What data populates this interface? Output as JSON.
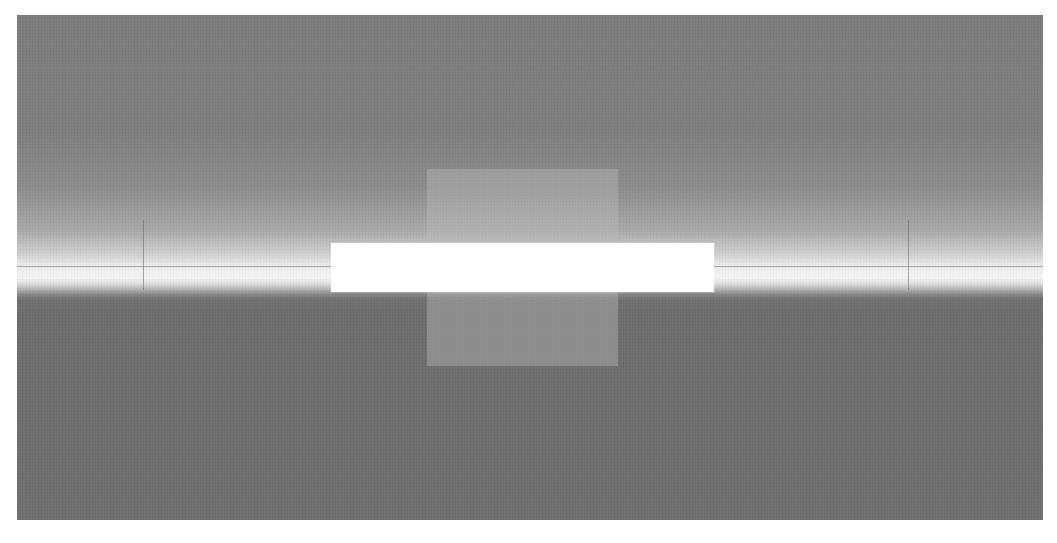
{
  "figure": {
    "background_top_color": "#7c7c7c",
    "background_bottom_color": "#6f6f6f",
    "horizon_glow_color": "#f4f4f4",
    "center_rect_color": "#a8a8a8",
    "bar_color": "#ffffff",
    "panel": {
      "x": 17,
      "y": 15,
      "width": 1026,
      "height": 505
    },
    "horizon_line": {
      "y": 266
    },
    "vertical_markers": [
      {
        "x": 143,
        "y1": 220,
        "y2": 290
      },
      {
        "x": 908,
        "y1": 220,
        "y2": 290
      }
    ],
    "center_rect": {
      "x": 427,
      "y": 169,
      "width": 191,
      "height": 197
    },
    "white_bar": {
      "x": 331,
      "y": 243,
      "width": 383,
      "height": 49
    }
  }
}
